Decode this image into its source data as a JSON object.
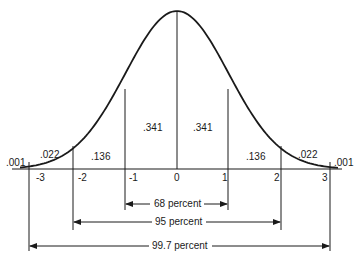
{
  "chart_data": {
    "type": "area",
    "xlabel": "",
    "ylabel": "",
    "x_ticks": [
      "-3",
      "-2",
      "-1",
      "0",
      "1",
      "2",
      "3"
    ],
    "regions": [
      {
        "from": "-inf",
        "to": -3,
        "proportion": 0.001,
        "label": ".001"
      },
      {
        "from": -3,
        "to": -2,
        "proportion": 0.022,
        "label": ".022"
      },
      {
        "from": -2,
        "to": -1,
        "proportion": 0.136,
        "label": ".136"
      },
      {
        "from": -1,
        "to": 0,
        "proportion": 0.341,
        "label": ".341"
      },
      {
        "from": 0,
        "to": 1,
        "proportion": 0.341,
        "label": ".341"
      },
      {
        "from": 1,
        "to": 2,
        "proportion": 0.136,
        "label": ".136"
      },
      {
        "from": 2,
        "to": 3,
        "proportion": 0.022,
        "label": ".022"
      },
      {
        "from": 3,
        "to": "inf",
        "proportion": 0.001,
        "label": ".001"
      }
    ],
    "ranges": [
      {
        "from": -1,
        "to": 1,
        "label": "68 percent"
      },
      {
        "from": -2,
        "to": 2,
        "label": "95 percent"
      },
      {
        "from": -3,
        "to": 3,
        "label": "99.7 percent"
      }
    ],
    "xlim": [
      -3.4,
      3.2
    ],
    "grid": false,
    "legend": null
  },
  "labels": {
    "tail_left": ".001",
    "r_m3_m2": ".022",
    "r_m2_m1": ".136",
    "r_m1_0": ".341",
    "r_0_1": ".341",
    "r_1_2": ".136",
    "r_2_3": ".022",
    "tail_right": ".001",
    "tick_m3": "-3",
    "tick_m2": "-2",
    "tick_m1": "-1",
    "tick_0": "0",
    "tick_1": "1",
    "tick_2": "2",
    "tick_3": "3",
    "range_68": "68 percent",
    "range_95": "95 percent",
    "range_997": "99.7 percent"
  }
}
